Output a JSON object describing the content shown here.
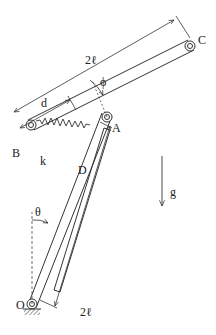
{
  "diagram": {
    "type": "mechanism",
    "points": {
      "O": "O",
      "A": "A",
      "B": "B",
      "C": "C",
      "D": "D"
    },
    "labels": {
      "length_upper": "2ℓ",
      "length_lower": "2ℓ",
      "offset": "d",
      "spring": "k",
      "gravity": "g",
      "angle_theta": "θ",
      "angle_phi": "ϕ"
    },
    "colors": {
      "stroke": "#333333",
      "background": "#ffffff"
    }
  }
}
